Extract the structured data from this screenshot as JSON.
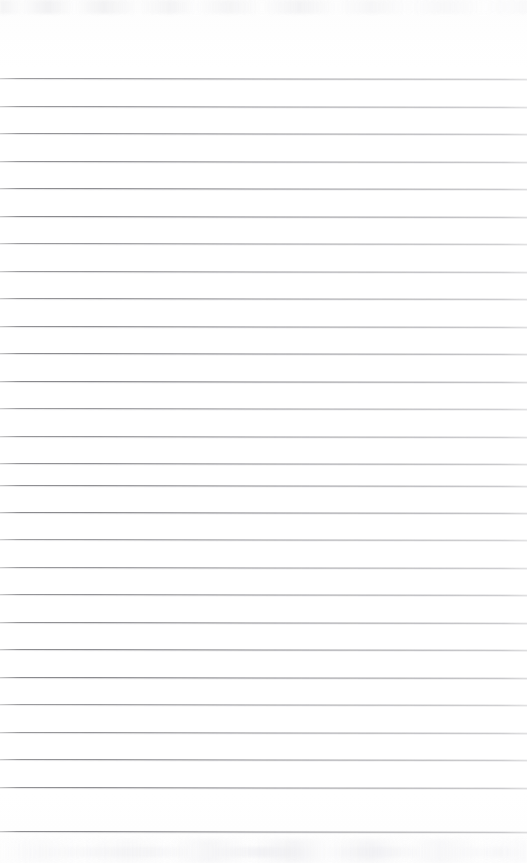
{
  "document": {
    "kind": "scanned-lined-paper",
    "title": "",
    "visible_text": "",
    "page_width": 527,
    "page_height": 863,
    "background_color": "#fefefe",
    "has_handwriting": false,
    "has_printed_text": false
  },
  "ruling": {
    "line_color": "#75757a",
    "line_count": 28,
    "line_spacing_px": 27.5,
    "first_line_y": 78,
    "last_line_y": 831,
    "line_thickness_px": 1,
    "line_start_x": 0,
    "line_end_x": 527,
    "slant_degrees": 0.085,
    "lines_y": [
      78,
      105.5,
      133,
      160.5,
      188,
      215.5,
      243,
      270.5,
      298,
      325.5,
      353,
      380.5,
      408,
      435.5,
      463,
      484.5,
      511.5,
      539,
      566.5,
      594,
      621.5,
      649,
      676.5,
      704,
      731.5,
      759,
      786.5,
      831
    ]
  },
  "margins": {
    "top_blank_px": 78,
    "bottom_blank_px": 32,
    "left_margin_rule": false,
    "right_margin_rule": false
  },
  "artifacts": {
    "top_ghost_label": "faint scanner bleed-through band",
    "bottom_ghost_label": "faint scanner bleed-through band",
    "top_ghost_height_px": 14,
    "bottom_ghost_height_px": 24,
    "vignette": "subtle edge shading"
  }
}
